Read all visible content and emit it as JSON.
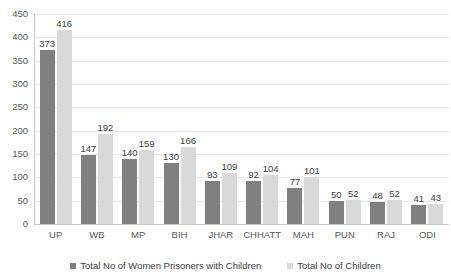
{
  "chart_data": {
    "type": "bar",
    "title": "",
    "subtitle": "",
    "xlabel": "",
    "ylabel": "",
    "ylim": [
      0,
      450
    ],
    "yticks": [
      0,
      50,
      100,
      150,
      200,
      250,
      300,
      350,
      400,
      450
    ],
    "grid": true,
    "legend_position": "bottom",
    "categories": [
      "UP",
      "WB",
      "MP",
      "BIH",
      "JHAR",
      "CHHATT",
      "MAH",
      "PUN",
      "RAJ",
      "ODI"
    ],
    "series": [
      {
        "name": "Total No of Women Prisoners with Children",
        "color": "#808080",
        "values": [
          373,
          147,
          140,
          130,
          93,
          92,
          77,
          50,
          48,
          41
        ]
      },
      {
        "name": "Total No of Children",
        "color": "#d9d9d9",
        "values": [
          416,
          192,
          159,
          166,
          109,
          104,
          101,
          52,
          52,
          43
        ]
      }
    ]
  },
  "axis": {
    "y_tick_labels": [
      "450",
      "400",
      "350",
      "300",
      "250",
      "200",
      "150",
      "100",
      "50",
      "0"
    ]
  },
  "legend": {
    "items": [
      {
        "label": "Total No of Women Prisoners with Children",
        "color": "#808080"
      },
      {
        "label": "Total No of Children",
        "color": "#d9d9d9"
      }
    ]
  },
  "colors": {
    "series1": "#808080",
    "series2": "#d9d9d9",
    "gridline": "#e8e8e8",
    "axis": "#c8c8c8",
    "text": "#404040",
    "background": "#ffffff"
  }
}
